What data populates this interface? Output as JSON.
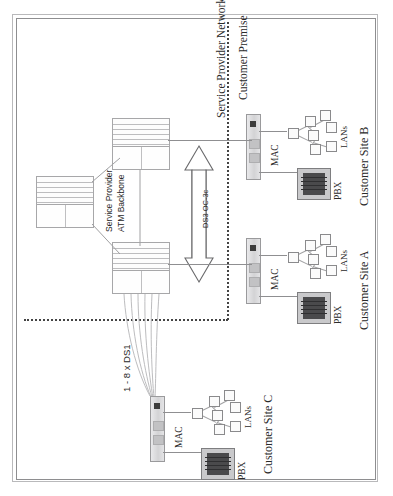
{
  "figure": {
    "orientation": "rotated-90-ccw",
    "type": "network-diagram",
    "background": "#ffffff",
    "frame_color": "#b9b9bb"
  },
  "boundaries": {
    "service_provider_network_label": "Service Provider Network",
    "customer_premise_label": "Customer Premise",
    "divider_style": "dotted"
  },
  "provider": {
    "backbone_label_line1": "Service Provider",
    "backbone_label_line2": "ATM Backbone",
    "switches": [
      {
        "name": "atm-switch-core",
        "id": "sw-core"
      },
      {
        "name": "atm-switch-upper-edge",
        "id": "sw-upper"
      },
      {
        "name": "atm-switch-lower-edge",
        "id": "sw-lower"
      }
    ]
  },
  "links": {
    "trunk_label": "DS3 OC-3c",
    "access_label": "1 - 8 x DS1",
    "trunk_arrow": "double-headed"
  },
  "sites": [
    {
      "title": "Customer Site B",
      "mac_label": "MAC",
      "lans_label": "LANs",
      "pbx_label": "PBX"
    },
    {
      "title": "Customer Site A",
      "mac_label": "MAC",
      "lans_label": "LANs",
      "pbx_label": "PBX"
    },
    {
      "title": "Customer Site C",
      "mac_label": "MAC",
      "lans_label": "LANs",
      "pbx_label": "PBX"
    }
  ],
  "colors": {
    "ink": "#2a2a2a",
    "line": "#8f8f91",
    "switch_fill": "#fdfdfd",
    "mac_fill": "#d9d9db",
    "pbx_fill": "#c9c9cb",
    "dotted": "#444444"
  }
}
